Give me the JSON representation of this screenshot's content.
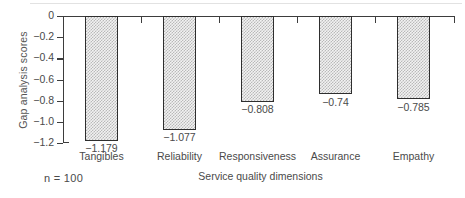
{
  "chart_data": {
    "type": "bar",
    "title": "",
    "subtitle": "",
    "xlabel": "Service quality dimensions",
    "ylabel": "Gap analysis scores",
    "categories": [
      "Tangibles",
      "Reliability",
      "Responsiveness",
      "Assurance",
      "Empathy"
    ],
    "values": [
      -1.179,
      -1.077,
      -0.808,
      -0.74,
      -0.785
    ],
    "value_labels": [
      "−1.179",
      "−1.077",
      "−0.808",
      "−0.74",
      "−0.785"
    ],
    "ylim": [
      -1.2,
      0
    ],
    "ytick_values": [
      0,
      -0.2,
      -0.4,
      -0.6,
      -0.8,
      -1.0,
      -1.2
    ],
    "ytick_labels": [
      "0",
      "−0.2",
      "−0.4",
      "−0.6",
      "−0.8",
      "−1.0",
      "−1.2"
    ],
    "grid": false,
    "legend": null,
    "orientation": "vertical",
    "bar_fill": "#f2f2f2",
    "bar_pattern": "fine-checkerboard-dither",
    "bar_edge_color": "#2e2e2e",
    "axis_color": "#3d3d3d",
    "text_color": "#4a4a4a"
  },
  "annotations": {
    "sample_size": "n = 100"
  },
  "icons": {
    "ytick_mark": "tick-mark",
    "xtick_mark": "tick-mark"
  }
}
